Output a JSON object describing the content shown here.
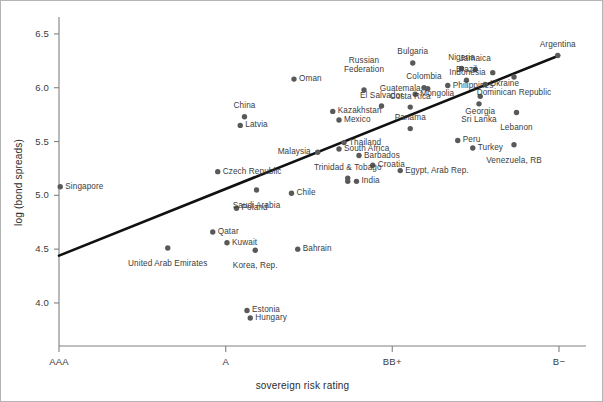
{
  "figure": {
    "xlabel": "sovereign risk rating",
    "ylabel": "log (bond spreads)",
    "marker_color": "#595959",
    "line_color": "#111111",
    "axis_color": "#808080"
  },
  "chart_data": {
    "type": "scatter",
    "title": "",
    "xlabel": "sovereign risk rating",
    "ylabel": "log (bond spreads)",
    "grid": false,
    "legend": "none",
    "xlim": [
      0,
      20
    ],
    "ylim": [
      3.6,
      6.62
    ],
    "ytick_labels": [
      "4.0",
      "4.5",
      "5.0",
      "5.5",
      "6.0",
      "6.5"
    ],
    "ytick_values": [
      4.0,
      4.5,
      5.0,
      5.5,
      6.0,
      6.5
    ],
    "xtick_labels": [
      "AAA",
      "A",
      "BB+",
      "B−"
    ],
    "xtick_values": [
      0,
      6.67,
      13.33,
      20
    ],
    "annotations": [
      "Linear fit / trend line drawn from approx (AAA, 4.44) to (B−, 6.30)"
    ],
    "trendline": {
      "x": [
        0,
        20
      ],
      "y": [
        4.44,
        6.3
      ]
    },
    "points": [
      {
        "label": "Singapore",
        "x": 0.05,
        "y": 5.08,
        "lx": 5,
        "ly": 0,
        "align": "l"
      },
      {
        "label": "United Arab Emirates",
        "x": 4.35,
        "y": 4.51,
        "lx": 0,
        "ly": 10,
        "align": "c"
      },
      {
        "label": "Qatar",
        "x": 6.15,
        "y": 4.66,
        "lx": 5,
        "ly": 0,
        "align": "l"
      },
      {
        "label": "Kuwait",
        "x": 6.72,
        "y": 4.56,
        "lx": 5,
        "ly": 0,
        "align": "l"
      },
      {
        "label": "Korea, Rep.",
        "x": 7.85,
        "y": 4.49,
        "lx": 0,
        "ly": 10,
        "align": "c"
      },
      {
        "label": "Bahrain",
        "x": 9.55,
        "y": 4.5,
        "lx": 5,
        "ly": 0,
        "align": "l"
      },
      {
        "label": "Estonia",
        "x": 7.52,
        "y": 3.93,
        "lx": 5,
        "ly": 0,
        "align": "l"
      },
      {
        "label": "Hungary",
        "x": 7.65,
        "y": 3.86,
        "lx": 5,
        "ly": 0,
        "align": "l"
      },
      {
        "label": "Poland",
        "x": 7.1,
        "y": 4.88,
        "lx": 5,
        "ly": 0,
        "align": "l"
      },
      {
        "label": "Czech Republic",
        "x": 6.35,
        "y": 5.22,
        "lx": 5,
        "ly": 0,
        "align": "l"
      },
      {
        "label": "Saudi Arabia",
        "x": 7.9,
        "y": 5.05,
        "lx": 0,
        "ly": 10,
        "align": "c"
      },
      {
        "label": "Chile",
        "x": 9.3,
        "y": 5.02,
        "lx": 5,
        "ly": 0,
        "align": "l"
      },
      {
        "label": "Latvia",
        "x": 7.25,
        "y": 5.65,
        "lx": 5,
        "ly": 0,
        "align": "l"
      },
      {
        "label": "China",
        "x": 7.42,
        "y": 5.73,
        "lx": 0,
        "ly": -10,
        "align": "c"
      },
      {
        "label": "Oman",
        "x": 9.4,
        "y": 6.08,
        "lx": 5,
        "ly": 0,
        "align": "l"
      },
      {
        "label": "Kazakhstan",
        "x": 10.95,
        "y": 5.78,
        "lx": 5,
        "ly": 0,
        "align": "l"
      },
      {
        "label": "Mexico",
        "x": 11.2,
        "y": 5.7,
        "lx": 5,
        "ly": 0,
        "align": "l"
      },
      {
        "label": "Malaysia",
        "x": 10.35,
        "y": 5.4,
        "lx": -5,
        "ly": 0,
        "align": "r"
      },
      {
        "label": "Thailand",
        "x": 11.4,
        "y": 5.49,
        "lx": 5,
        "ly": 0,
        "align": "l"
      },
      {
        "label": "South Africa",
        "x": 11.2,
        "y": 5.43,
        "lx": 5,
        "ly": 0,
        "align": "l"
      },
      {
        "label": "Barbados",
        "x": 12.0,
        "y": 5.37,
        "lx": 5,
        "ly": 0,
        "align": "l"
      },
      {
        "label": "Trinidad & Tobago",
        "x": 11.55,
        "y": 5.16,
        "lx": 0,
        "ly": -10,
        "align": "c"
      },
      {
        "label": "India",
        "x": 11.9,
        "y": 5.13,
        "lx": 5,
        "ly": 0,
        "align": "l"
      },
      {
        "label": "India2",
        "x": 11.55,
        "y": 5.13,
        "lx": 0,
        "ly": 0,
        "align": "c",
        "hide_label": true
      },
      {
        "label": "Croatia",
        "x": 12.55,
        "y": 5.28,
        "lx": 5,
        "ly": 0,
        "align": "l"
      },
      {
        "label": "Russian\nFederation",
        "x": 12.2,
        "y": 5.98,
        "lx": 0,
        "ly": -19,
        "align": "c"
      },
      {
        "label": "El Salvador",
        "x": 12.9,
        "y": 5.83,
        "lx": 0,
        "ly": -10,
        "align": "c"
      },
      {
        "label": "Costa Rica",
        "x": 14.05,
        "y": 5.82,
        "lx": 0,
        "ly": -10,
        "align": "c"
      },
      {
        "label": "Panama",
        "x": 14.05,
        "y": 5.62,
        "lx": 0,
        "ly": -10,
        "align": "c"
      },
      {
        "label": "Colombia",
        "x": 14.6,
        "y": 6.0,
        "lx": 0,
        "ly": -10,
        "align": "c"
      },
      {
        "label": "Mongolia",
        "x": 14.25,
        "y": 5.94,
        "lx": 5,
        "ly": 0,
        "align": "l"
      },
      {
        "label": "Guatemala",
        "x": 14.75,
        "y": 5.99,
        "lx": -5,
        "ly": 0,
        "align": "r"
      },
      {
        "label": "Egypt, Arab Rep.",
        "x": 13.65,
        "y": 5.23,
        "lx": 5,
        "ly": 0,
        "align": "l"
      },
      {
        "label": "Bulgaria",
        "x": 14.15,
        "y": 6.23,
        "lx": 0,
        "ly": -10,
        "align": "c"
      },
      {
        "label": "Philippines",
        "x": 15.55,
        "y": 6.02,
        "lx": 5,
        "ly": 0,
        "align": "l"
      },
      {
        "label": "Nigeria",
        "x": 16.1,
        "y": 6.18,
        "lx": 0,
        "ly": -10,
        "align": "c"
      },
      {
        "label": "Jamaica",
        "x": 16.65,
        "y": 6.17,
        "lx": 0,
        "ly": -10,
        "align": "c"
      },
      {
        "label": "Brazil",
        "x": 16.3,
        "y": 6.07,
        "lx": 0,
        "ly": -10,
        "align": "c"
      },
      {
        "label": "Indonesia",
        "x": 17.35,
        "y": 6.14,
        "lx": -5,
        "ly": 0,
        "align": "r"
      },
      {
        "label": "Ukraine",
        "x": 17.05,
        "y": 6.03,
        "lx": 5,
        "ly": 0,
        "align": "l"
      },
      {
        "label": "Georgia",
        "x": 16.85,
        "y": 5.92,
        "lx": 0,
        "ly": 10,
        "align": "c"
      },
      {
        "label": "Sri Lanka",
        "x": 16.8,
        "y": 5.85,
        "lx": 0,
        "ly": 10,
        "align": "c"
      },
      {
        "label": "Dominican Republic",
        "x": 18.2,
        "y": 6.1,
        "lx": 0,
        "ly": 10,
        "align": "c"
      },
      {
        "label": "Argentina",
        "x": 19.95,
        "y": 6.3,
        "lx": 0,
        "ly": -10,
        "align": "c"
      },
      {
        "label": "Lebanon",
        "x": 18.3,
        "y": 5.77,
        "lx": 0,
        "ly": 10,
        "align": "c"
      },
      {
        "label": "Peru",
        "x": 15.95,
        "y": 5.51,
        "lx": 5,
        "ly": 0,
        "align": "l"
      },
      {
        "label": "Turkey",
        "x": 16.55,
        "y": 5.44,
        "lx": 5,
        "ly": 0,
        "align": "l"
      },
      {
        "label": "Venezuela, RB",
        "x": 18.2,
        "y": 5.47,
        "lx": 0,
        "ly": 10,
        "align": "c"
      }
    ]
  }
}
